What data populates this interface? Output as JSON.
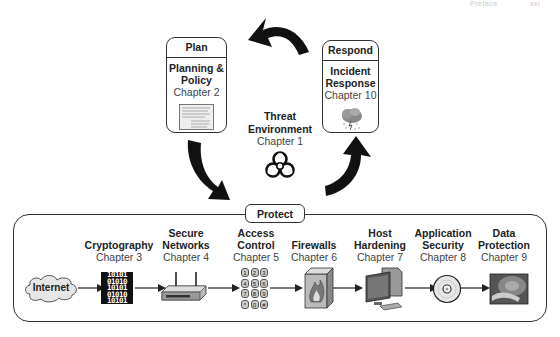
{
  "page_header": {
    "section": "Preface",
    "page": "xxi"
  },
  "cycle": {
    "plan": {
      "header": "Plan",
      "title_line1": "Planning &",
      "title_line2": "Policy",
      "chapter": "Chapter 2",
      "icon": "document-icon"
    },
    "respond": {
      "header": "Respond",
      "title_line1": "Incident",
      "title_line2": "Response",
      "chapter": "Chapter 10",
      "icon": "storm-cloud-icon"
    },
    "threat": {
      "title_line1": "Threat",
      "title_line2": "Environment",
      "chapter": "Chapter 1",
      "icon": "biohazard-icon"
    },
    "arrows": [
      "respond-to-plan",
      "plan-to-protect",
      "protect-to-respond"
    ]
  },
  "protect": {
    "label": "Protect",
    "source": {
      "label": "Internet",
      "icon": "cloud-icon"
    },
    "items": [
      {
        "title_line1": "",
        "title_line2": "Cryptography",
        "chapter": "Chapter 3",
        "icon": "binary-icon"
      },
      {
        "title_line1": "Secure",
        "title_line2": "Networks",
        "chapter": "Chapter 4",
        "icon": "router-icon"
      },
      {
        "title_line1": "Access",
        "title_line2": "Control",
        "chapter": "Chapter 5",
        "icon": "keypad-icon"
      },
      {
        "title_line1": "",
        "title_line2": "Firewalls",
        "chapter": "Chapter 6",
        "icon": "firewall-icon"
      },
      {
        "title_line1": "Host",
        "title_line2": "Hardening",
        "chapter": "Chapter 7",
        "icon": "computer-icon"
      },
      {
        "title_line1": "Application",
        "title_line2": "Security",
        "chapter": "Chapter 8",
        "icon": "disc-icon"
      },
      {
        "title_line1": "Data",
        "title_line2": "Protection",
        "chapter": "Chapter 9",
        "icon": "hard-drive-icon"
      }
    ],
    "keypad_keys": [
      "1",
      "2",
      "3",
      "4",
      "5",
      "6",
      "7",
      "8",
      "9",
      "*",
      "0",
      "#"
    ],
    "binary_rows": [
      "10101",
      "01010",
      "10101",
      "01010",
      "10101"
    ]
  }
}
